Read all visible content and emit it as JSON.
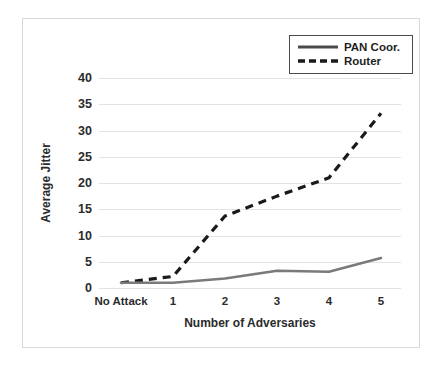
{
  "chart_data": {
    "type": "line",
    "title": "",
    "xlabel": "Number of Adversaries",
    "ylabel": "Average Jitter",
    "categories": [
      "No Attack",
      "1",
      "2",
      "3",
      "4",
      "5"
    ],
    "ylim": [
      0,
      40
    ],
    "yticks": [
      0,
      5,
      10,
      15,
      20,
      25,
      30,
      35,
      40
    ],
    "ytick_labels": [
      "0",
      "5",
      "10",
      "15",
      "20",
      "25",
      "30",
      "35",
      "40"
    ],
    "grid": true,
    "legend_position": "top-right",
    "series": [
      {
        "name": "PAN Coor.",
        "style": "solid",
        "color": "#7a7a7a",
        "values": [
          1.0,
          1.0,
          1.8,
          3.3,
          3.1,
          5.7
        ]
      },
      {
        "name": "Router",
        "style": "dashed",
        "color": "#1a1a1a",
        "values": [
          1.0,
          2.2,
          13.7,
          17.5,
          21.0,
          33.3
        ]
      }
    ]
  },
  "legend": {
    "items": [
      {
        "label": "PAN Coor."
      },
      {
        "label": "Router"
      }
    ]
  },
  "colors": {
    "grid": "#e3e3e3",
    "frame": "#d9d9d9",
    "text": "#2b2b2b",
    "pan_coor": "#7a7a7a",
    "router": "#1a1a1a"
  }
}
